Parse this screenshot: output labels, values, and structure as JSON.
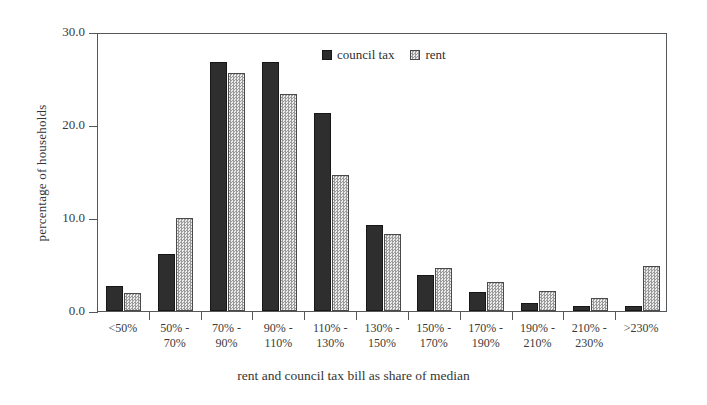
{
  "chart_data": {
    "type": "bar",
    "title": "",
    "xlabel": "rent and council tax bill as share of median",
    "ylabel": "percentage of households",
    "ylim": [
      0,
      30
    ],
    "yticks": [
      "0.0",
      "10.0",
      "20.0",
      "30.0"
    ],
    "ytick_values": [
      0,
      10,
      20,
      30
    ],
    "grid": false,
    "legend_position": "top-center",
    "categories": [
      "<50%",
      "50% -\n70%",
      "70% -\n90%",
      "90% -\n110%",
      "110% -\n130%",
      "130% -\n150%",
      "150% -\n170%",
      "170% -\n190%",
      "190% -\n210%",
      "210% -\n230%",
      ">230%"
    ],
    "series": [
      {
        "name": "council tax",
        "color": "#2e2e2e",
        "values": [
          2.7,
          6.1,
          26.8,
          26.8,
          21.3,
          9.3,
          3.9,
          2.0,
          0.9,
          0.5,
          0.5
        ]
      },
      {
        "name": "rent",
        "color": "#e2e2e2",
        "values": [
          1.9,
          10.0,
          25.6,
          23.3,
          14.6,
          8.3,
          4.6,
          3.1,
          2.1,
          1.4,
          4.8
        ]
      }
    ]
  },
  "legend": {
    "items": [
      {
        "label": "council tax",
        "swatch": "council"
      },
      {
        "label": "rent",
        "swatch": "rent"
      }
    ]
  }
}
